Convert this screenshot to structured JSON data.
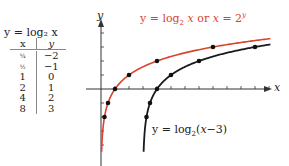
{
  "table": {
    "title": "y = log₂ x",
    "header": {
      "x": "x",
      "y": "y"
    },
    "rows": [
      {
        "x": "¼",
        "y": "−2"
      },
      {
        "x": "½",
        "y": "−1"
      },
      {
        "x": "1",
        "y": "0"
      },
      {
        "x": "2",
        "y": "1"
      },
      {
        "x": "4",
        "y": "2"
      },
      {
        "x": "8",
        "y": "3"
      }
    ]
  },
  "labels": {
    "red_curve": "y = log₂ x or x = 2ʸ",
    "black_curve": "y = log₂(x−3)",
    "x_axis": "x",
    "y_axis": "y"
  },
  "colors": {
    "red_curve": "#d9442b",
    "black_curve": "#1a1a1a",
    "axis": "#333333"
  },
  "chart_data": {
    "type": "line",
    "title": "",
    "xlabel": "x",
    "ylabel": "y",
    "xlim": [
      0,
      12
    ],
    "ylim": [
      -4,
      4
    ],
    "grid": false,
    "x_ticks": [
      1,
      2,
      3,
      4,
      5,
      6,
      7,
      8,
      9,
      10,
      11,
      12
    ],
    "y_ticks": [
      -4,
      -3,
      -2,
      -1,
      1,
      2,
      3,
      4
    ],
    "series": [
      {
        "name": "y = log₂ x or x = 2^y",
        "color": "#d9442b",
        "function": "log2(x)",
        "points": [
          [
            0.25,
            -2
          ],
          [
            0.5,
            -1
          ],
          [
            1,
            0
          ],
          [
            2,
            1
          ],
          [
            4,
            2
          ],
          [
            8,
            3
          ]
        ]
      },
      {
        "name": "y = log₂(x−3)",
        "color": "#1a1a1a",
        "function": "log2(x-3)",
        "points": [
          [
            3.25,
            -2
          ],
          [
            3.5,
            -1
          ],
          [
            4,
            0
          ],
          [
            5,
            1
          ],
          [
            7,
            2
          ],
          [
            11,
            3
          ]
        ]
      }
    ],
    "origin_px": [
      101,
      89
    ],
    "unit_px": 14
  }
}
